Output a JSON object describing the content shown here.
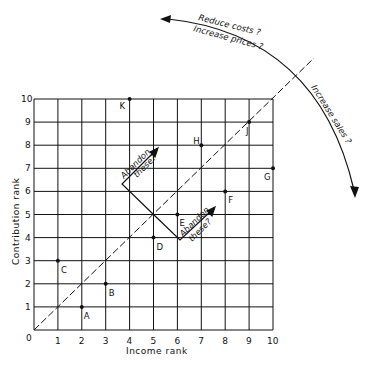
{
  "chart_data": {
    "type": "scatter",
    "title": "",
    "xlabel": "Income rank",
    "ylabel": "Contribution rank",
    "xlim": [
      0,
      10
    ],
    "ylim": [
      0,
      10
    ],
    "grid": true,
    "x_ticks": [
      "0",
      "1",
      "2",
      "3",
      "4",
      "5",
      "6",
      "7",
      "8",
      "9",
      "10"
    ],
    "y_ticks": [
      "1",
      "2",
      "3",
      "4",
      "5",
      "6",
      "7",
      "8",
      "9",
      "10"
    ],
    "points": [
      {
        "label": "A",
        "x": 2,
        "y": 1
      },
      {
        "label": "B",
        "x": 3,
        "y": 2
      },
      {
        "label": "C",
        "x": 1,
        "y": 3
      },
      {
        "label": "D",
        "x": 5,
        "y": 4
      },
      {
        "label": "E",
        "x": 6,
        "y": 5
      },
      {
        "label": "F",
        "x": 8,
        "y": 6
      },
      {
        "label": "G",
        "x": 10,
        "y": 7
      },
      {
        "label": "H",
        "x": 7,
        "y": 8
      },
      {
        "label": "J",
        "x": 9,
        "y": 9
      },
      {
        "label": "K",
        "x": 4,
        "y": 10
      }
    ],
    "reference_line": {
      "style": "dashed",
      "from": [
        0,
        0
      ],
      "to": [
        10,
        10
      ],
      "extends_beyond": true
    },
    "annotations": {
      "abandon_upper": [
        "Abandon",
        "these?"
      ],
      "abandon_lower": [
        "Abandon",
        "these?"
      ],
      "arc_left_line1": "Reduce costs ?",
      "arc_left_line2": "Increase prices ?",
      "arc_right": "Increase sales ?"
    }
  }
}
